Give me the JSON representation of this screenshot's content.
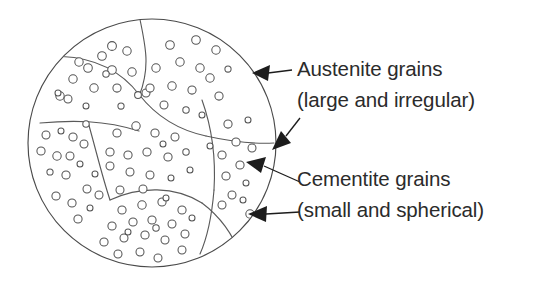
{
  "figure": {
    "background_color": "#ffffff",
    "outline_color": "#4a4a4a",
    "dot_outline_color": "#555555",
    "text_color": "#2b2b2b",
    "arrow_color": "#1c1c1c"
  },
  "labels": [
    {
      "id": "austenite",
      "line1": "Austenite grains",
      "line2": "(large and irregular)",
      "x": 297,
      "y1": 76,
      "y2": 107
    },
    {
      "id": "cementite",
      "line1": "Cementite grains",
      "line2": "(small and spherical)",
      "x": 297,
      "y1": 186,
      "y2": 217
    }
  ],
  "specimen": {
    "center_x": 152,
    "center_y": 143,
    "radius": 124
  },
  "grain_boundaries": [
    "M 140 19.5 C 146 48 150 68 139.5 95",
    "M 139.5 95 C 122 72 96 58 62 56.5",
    "M 139.5 95 C 156 116 178 130 206 136",
    "M 206 136 C 233 142 256 144 274 143",
    "M 40 123 C 72 120 104 120 139 131",
    "M 88 122 C 96 150 102 176 110 200",
    "M 110 200 C 140 186 175 186 202 203",
    "M 202 203 C 222 218 236 240 243 262",
    "M 202 100 C 212 128 216 158 214 190",
    "M 214 190 C 212 214 208 236 200 254"
  ],
  "cementite_dots": [
    {
      "cx": 73,
      "cy": 79,
      "r": 4.2
    },
    {
      "cx": 60,
      "cy": 96,
      "r": 4.2
    },
    {
      "cx": 68,
      "cy": 99,
      "r": 4.0
    },
    {
      "cx": 88,
      "cy": 68,
      "r": 4.3
    },
    {
      "cx": 102,
      "cy": 56,
      "r": 4.3
    },
    {
      "cx": 112,
      "cy": 46,
      "r": 4.4
    },
    {
      "cx": 127,
      "cy": 51,
      "r": 4.2
    },
    {
      "cx": 112,
      "cy": 70,
      "r": 4.3
    },
    {
      "cx": 94,
      "cy": 88,
      "r": 4.2
    },
    {
      "cx": 79,
      "cy": 62,
      "r": 4.2
    },
    {
      "cx": 117,
      "cy": 88,
      "r": 4.1
    },
    {
      "cx": 106,
      "cy": 74,
      "r": 3.2
    },
    {
      "cx": 132,
      "cy": 72,
      "r": 4.2
    },
    {
      "cx": 86,
      "cy": 106,
      "r": 3.0
    },
    {
      "cx": 121,
      "cy": 106,
      "r": 3.1
    },
    {
      "cx": 58,
      "cy": 93,
      "r": 3.0
    },
    {
      "cx": 138,
      "cy": 95,
      "r": 3.4
    },
    {
      "cx": 146,
      "cy": 93,
      "r": 4.0
    },
    {
      "cx": 170,
      "cy": 45,
      "r": 4.3
    },
    {
      "cx": 196,
      "cy": 40,
      "r": 4.3
    },
    {
      "cx": 216,
      "cy": 50,
      "r": 4.2
    },
    {
      "cx": 180,
      "cy": 62,
      "r": 4.2
    },
    {
      "cx": 200,
      "cy": 68,
      "r": 4.2
    },
    {
      "cx": 156,
      "cy": 68,
      "r": 4.2
    },
    {
      "cx": 172,
      "cy": 86,
      "r": 4.2
    },
    {
      "cx": 192,
      "cy": 90,
      "r": 4.1
    },
    {
      "cx": 210,
      "cy": 78,
      "r": 4.2
    },
    {
      "cx": 228,
      "cy": 69,
      "r": 3.1
    },
    {
      "cx": 150,
      "cy": 88,
      "r": 4.1
    },
    {
      "cx": 219,
      "cy": 96,
      "r": 4.1
    },
    {
      "cx": 164,
      "cy": 105,
      "r": 4.0
    },
    {
      "cx": 186,
      "cy": 110,
      "r": 3.2
    },
    {
      "cx": 202,
      "cy": 115,
      "r": 3.0
    },
    {
      "cx": 46,
      "cy": 135,
      "r": 4.0
    },
    {
      "cx": 61,
      "cy": 131,
      "r": 3.0
    },
    {
      "cx": 73,
      "cy": 137,
      "r": 4.1
    },
    {
      "cx": 41,
      "cy": 151,
      "r": 4.1
    },
    {
      "cx": 57,
      "cy": 156,
      "r": 4.2
    },
    {
      "cx": 70,
      "cy": 156,
      "r": 4.0
    },
    {
      "cx": 84,
      "cy": 144,
      "r": 4.0
    },
    {
      "cx": 50,
      "cy": 172,
      "r": 3.1
    },
    {
      "cx": 66,
      "cy": 175,
      "r": 4.1
    },
    {
      "cx": 80,
      "cy": 164,
      "r": 3.0
    },
    {
      "cx": 56,
      "cy": 196,
      "r": 4.1
    },
    {
      "cx": 72,
      "cy": 203,
      "r": 4.1
    },
    {
      "cx": 87,
      "cy": 189,
      "r": 4.0
    },
    {
      "cx": 78,
      "cy": 219,
      "r": 4.1
    },
    {
      "cx": 90,
      "cy": 208,
      "r": 3.0
    },
    {
      "cx": 86,
      "cy": 124,
      "r": 3.2
    },
    {
      "cx": 95,
      "cy": 174,
      "r": 3.0
    },
    {
      "cx": 99,
      "cy": 195,
      "r": 4.0
    },
    {
      "cx": 117,
      "cy": 133,
      "r": 4.1
    },
    {
      "cx": 136,
      "cy": 126,
      "r": 4.2
    },
    {
      "cx": 155,
      "cy": 133,
      "r": 4.1
    },
    {
      "cx": 175,
      "cy": 137,
      "r": 4.0
    },
    {
      "cx": 110,
      "cy": 152,
      "r": 4.1
    },
    {
      "cx": 128,
      "cy": 155,
      "r": 4.1
    },
    {
      "cx": 147,
      "cy": 152,
      "r": 4.1
    },
    {
      "cx": 168,
      "cy": 157,
      "r": 4.1
    },
    {
      "cx": 186,
      "cy": 152,
      "r": 3.2
    },
    {
      "cx": 110,
      "cy": 166,
      "r": 4.0
    },
    {
      "cx": 130,
      "cy": 172,
      "r": 4.0
    },
    {
      "cx": 150,
      "cy": 175,
      "r": 4.0
    },
    {
      "cx": 171,
      "cy": 178,
      "r": 3.0
    },
    {
      "cx": 120,
      "cy": 190,
      "r": 4.0
    },
    {
      "cx": 143,
      "cy": 189,
      "r": 4.0
    },
    {
      "cx": 163,
      "cy": 144,
      "r": 3.0
    },
    {
      "cx": 190,
      "cy": 170,
      "r": 3.0
    },
    {
      "cx": 122,
      "cy": 210,
      "r": 4.1
    },
    {
      "cx": 142,
      "cy": 205,
      "r": 4.2
    },
    {
      "cx": 162,
      "cy": 202,
      "r": 4.1
    },
    {
      "cx": 166,
      "cy": 198,
      "r": 3.0
    },
    {
      "cx": 182,
      "cy": 210,
      "r": 4.1
    },
    {
      "cx": 112,
      "cy": 226,
      "r": 4.1
    },
    {
      "cx": 133,
      "cy": 222,
      "r": 4.1
    },
    {
      "cx": 152,
      "cy": 220,
      "r": 4.1
    },
    {
      "cx": 172,
      "cy": 224,
      "r": 4.0
    },
    {
      "cx": 192,
      "cy": 218,
      "r": 3.0
    },
    {
      "cx": 104,
      "cy": 242,
      "r": 4.1
    },
    {
      "cx": 124,
      "cy": 238,
      "r": 4.0
    },
    {
      "cx": 145,
      "cy": 235,
      "r": 4.1
    },
    {
      "cx": 165,
      "cy": 240,
      "r": 4.0
    },
    {
      "cx": 185,
      "cy": 234,
      "r": 4.0
    },
    {
      "cx": 118,
      "cy": 254,
      "r": 4.0
    },
    {
      "cx": 140,
      "cy": 252,
      "r": 4.0
    },
    {
      "cx": 158,
      "cy": 258,
      "r": 4.0
    },
    {
      "cx": 182,
      "cy": 250,
      "r": 4.0
    },
    {
      "cx": 156,
      "cy": 228,
      "r": 3.2
    },
    {
      "cx": 128,
      "cy": 232,
      "r": 3.0
    },
    {
      "cx": 228,
      "cy": 124,
      "r": 4.1
    },
    {
      "cx": 248,
      "cy": 120,
      "r": 3.0
    },
    {
      "cx": 236,
      "cy": 142,
      "r": 4.1
    },
    {
      "cx": 252,
      "cy": 148,
      "r": 4.0
    },
    {
      "cx": 222,
      "cy": 155,
      "r": 4.1
    },
    {
      "cx": 240,
      "cy": 165,
      "r": 4.1
    },
    {
      "cx": 226,
      "cy": 176,
      "r": 4.1
    },
    {
      "cx": 246,
      "cy": 183,
      "r": 3.0
    },
    {
      "cx": 232,
      "cy": 195,
      "r": 4.0
    },
    {
      "cx": 250,
      "cy": 214,
      "r": 4.2
    },
    {
      "cx": 222,
      "cy": 205,
      "r": 4.0
    },
    {
      "cx": 243,
      "cy": 200,
      "r": 3.0
    },
    {
      "cx": 210,
      "cy": 146,
      "r": 3.0
    }
  ],
  "annotations": [
    {
      "id": "austenite-arrow",
      "line": "M 292 70 L 268 73",
      "head": "M 252 73 L 270 65 L 268 81 Z"
    },
    {
      "id": "cementite-arrow-upper",
      "line": "M 300 118 L 286 136",
      "head": "M 272 150 L 281 131 L 291 143 Z"
    },
    {
      "id": "cementite-arrow-mid",
      "line": "M 300 182 L 264 166",
      "head": "M 246 162 L 266 157 L 261 173 Z"
    },
    {
      "id": "cementite-arrow-lower",
      "line": "M 300 212 L 266 214",
      "head": "M 248 214 L 267 206 L 266 222 Z"
    }
  ]
}
